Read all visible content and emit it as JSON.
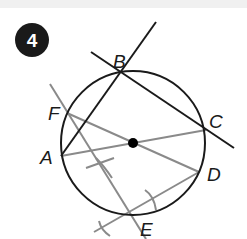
{
  "problem_number": "4",
  "points": {
    "A": {
      "label": "A",
      "x": 61,
      "y": 156
    },
    "B": {
      "label": "B",
      "x": 121,
      "y": 72
    },
    "C": {
      "label": "C",
      "x": 206,
      "y": 130
    },
    "D": {
      "label": "D",
      "x": 199,
      "y": 172
    },
    "E": {
      "label": "E",
      "x": 128,
      "y": 213
    },
    "F": {
      "label": "F",
      "x": 67,
      "y": 113
    }
  },
  "circle": {
    "cx": 133,
    "cy": 143,
    "r": 72
  },
  "colors": {
    "construction_black": "#1a1a1a",
    "construction_gray": "#8a8a8a",
    "badge": "#1a1a1a"
  }
}
